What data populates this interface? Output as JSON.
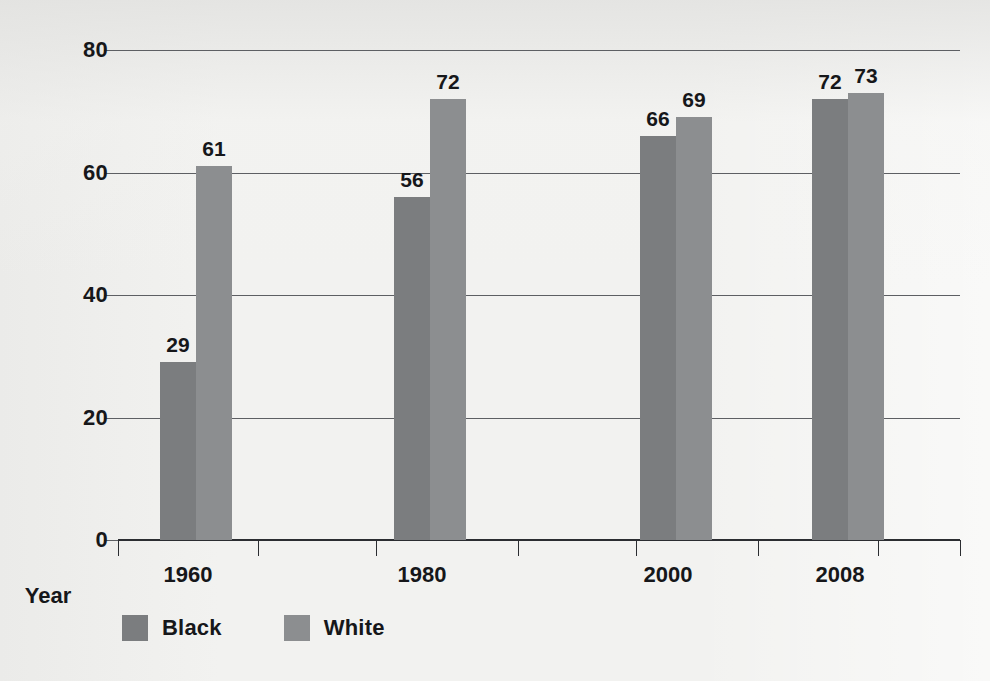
{
  "chart_data": {
    "type": "bar",
    "title": "",
    "subtitle": "",
    "xlabel": "Year",
    "ylabel": "Percentage of eligible voters\nregistered in the South",
    "categories": [
      "1960",
      "1980",
      "2000",
      "2008"
    ],
    "series": [
      {
        "name": "Black",
        "color": "#7b7d7f",
        "values": [
          29,
          56,
          66,
          72
        ]
      },
      {
        "name": "White",
        "color": "#8c8e90",
        "values": [
          61,
          72,
          69,
          73
        ]
      }
    ],
    "ylim": [
      0,
      80
    ],
    "ytick_labels": [
      "0",
      "20",
      "40",
      "60",
      "80"
    ],
    "ytick_values": [
      0,
      20,
      40,
      60,
      80
    ],
    "grid": true,
    "legend_position": "below-left",
    "data_labels": true
  },
  "axes": {
    "y": {
      "ticks": [
        {
          "label": "80",
          "value": 80
        },
        {
          "label": "60",
          "value": 60
        },
        {
          "label": "40",
          "value": 40
        },
        {
          "label": "20",
          "value": 20
        },
        {
          "label": "0",
          "value": 0
        }
      ],
      "title": "Percentage of eligible voters\nregistered in the South"
    },
    "x": {
      "title": "Year",
      "ticks": [
        "1960",
        "1980",
        "2000",
        "2008"
      ]
    }
  },
  "groups": [
    {
      "category": "1960",
      "bars": [
        {
          "series": "Black",
          "value": 29,
          "label": "29"
        },
        {
          "series": "White",
          "value": 61,
          "label": "61"
        }
      ]
    },
    {
      "category": "1980",
      "bars": [
        {
          "series": "Black",
          "value": 56,
          "label": "56"
        },
        {
          "series": "White",
          "value": 72,
          "label": "72"
        }
      ]
    },
    {
      "category": "2000",
      "bars": [
        {
          "series": "Black",
          "value": 66,
          "label": "66"
        },
        {
          "series": "White",
          "value": 69,
          "label": "69"
        }
      ]
    },
    {
      "category": "2008",
      "bars": [
        {
          "series": "Black",
          "value": 72,
          "label": "72"
        },
        {
          "series": "White",
          "value": 73,
          "label": "73"
        }
      ]
    }
  ],
  "legend": {
    "items": [
      {
        "label": "Black",
        "color": "#7b7d7f"
      },
      {
        "label": "White",
        "color": "#8c8e90"
      }
    ]
  },
  "colors": {
    "background": "#f2f2f0",
    "ink": "#16171a",
    "gridline": "#5d5f63",
    "axis": "#2b2d31",
    "black_series": "#7b7d7f",
    "white_series": "#8c8e90"
  }
}
